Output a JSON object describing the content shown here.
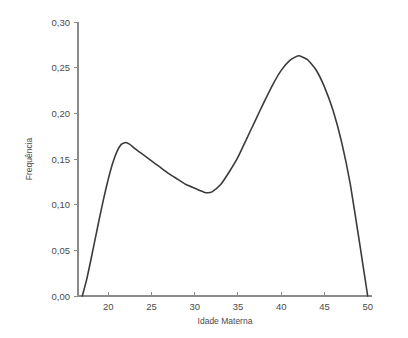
{
  "chart_data": {
    "type": "line",
    "title": "",
    "subtitle": "",
    "xlabel": "Idade Materna",
    "ylabel": "Frequência",
    "xlim": [
      16.5,
      50.5
    ],
    "ylim": [
      0.0,
      0.3
    ],
    "grid": false,
    "legend": null,
    "decimal_separator": ",",
    "x_ticks": [
      20,
      25,
      30,
      35,
      40,
      45,
      50
    ],
    "x_tick_labels": [
      "20",
      "25",
      "30",
      "35",
      "40",
      "45",
      "50"
    ],
    "y_ticks": [
      0.0,
      0.05,
      0.1,
      0.15,
      0.2,
      0.25,
      0.3
    ],
    "y_tick_labels": [
      "0,00",
      "0,05",
      "0,10",
      "0,15",
      "0,20",
      "0,25",
      "0,30"
    ],
    "series": [
      {
        "name": "Frequência",
        "color": "#3b3b3b",
        "x": [
          17.0,
          17.5,
          18.0,
          18.5,
          19.0,
          19.5,
          20.0,
          20.5,
          21.0,
          21.5,
          22.0,
          22.5,
          23.0,
          24.0,
          25.0,
          26.0,
          27.0,
          28.0,
          29.0,
          30.0,
          31.0,
          31.5,
          32.0,
          33.0,
          34.0,
          35.0,
          36.0,
          37.0,
          38.0,
          39.0,
          40.0,
          41.0,
          42.0,
          43.0,
          44.0,
          45.0,
          46.0,
          47.0,
          48.0,
          49.0,
          49.5,
          50.0
        ],
        "y": [
          0.0,
          0.018,
          0.04,
          0.063,
          0.086,
          0.108,
          0.128,
          0.145,
          0.158,
          0.166,
          0.168,
          0.166,
          0.162,
          0.155,
          0.148,
          0.141,
          0.134,
          0.128,
          0.122,
          0.118,
          0.114,
          0.113,
          0.114,
          0.122,
          0.136,
          0.152,
          0.172,
          0.192,
          0.212,
          0.231,
          0.247,
          0.258,
          0.263,
          0.259,
          0.248,
          0.229,
          0.203,
          0.168,
          0.122,
          0.062,
          0.031,
          0.0
        ]
      }
    ],
    "annotations": [
      {
        "label": "primeiro pico",
        "x": 22.0,
        "y": 0.168
      },
      {
        "label": "vale",
        "x": 31.5,
        "y": 0.113
      },
      {
        "label": "segundo pico",
        "x": 42.0,
        "y": 0.263
      }
    ]
  },
  "colors": {
    "curve": "#3b3b3b",
    "axis": "#8a8a8a",
    "text": "#4a4a4a",
    "background": "#ffffff"
  }
}
